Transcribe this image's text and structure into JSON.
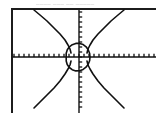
{
  "screen": {
    "header_text": "____ ___ __ _____",
    "frame_color": "#1c1c1c",
    "background_color": "#ffffff",
    "curve_color": "#111111",
    "axis_color": "#111111"
  },
  "chart_data": {
    "type": "scatter",
    "title": "",
    "xlabel": "",
    "ylabel": "",
    "grid": false,
    "legend": null,
    "axes": {
      "origin_px": [
        79,
        57
      ],
      "x_axis_y_px": 57,
      "y_axis_x_px": 79,
      "tick_spacing_px": 5,
      "xlim": [
        -13.6,
        15.4
      ],
      "ylim": [
        -11.2,
        9.8
      ],
      "tick_marks": "hash marks on both axes"
    },
    "series": [
      {
        "name": "unit-circle",
        "kind": "circle",
        "center": [
          0,
          0
        ],
        "radius_px": 11,
        "points_px": [
          [
            90,
            57
          ],
          [
            89.6,
            60.8
          ],
          [
            88.2,
            64.3
          ],
          [
            86.0,
            67.2
          ],
          [
            83.1,
            69.4
          ],
          [
            79.6,
            70.8
          ],
          [
            75.8,
            70.9
          ],
          [
            72.2,
            69.7
          ],
          [
            69.3,
            67.5
          ],
          [
            67.2,
            64.5
          ],
          [
            66.2,
            61.0
          ],
          [
            66.2,
            53.2
          ],
          [
            67.3,
            49.8
          ],
          [
            69.4,
            46.8
          ],
          [
            72.3,
            44.7
          ],
          [
            75.8,
            43.4
          ],
          [
            79.6,
            43.4
          ],
          [
            83.2,
            44.6
          ],
          [
            86.1,
            46.8
          ],
          [
            88.2,
            49.7
          ],
          [
            89.6,
            53.2
          ],
          [
            90,
            57
          ]
        ]
      },
      {
        "name": "branch-upper-left",
        "kind": "curve",
        "points_px": [
          [
            34,
            10
          ],
          [
            40,
            15
          ],
          [
            47,
            21
          ],
          [
            54,
            28
          ],
          [
            60,
            34
          ],
          [
            65,
            40
          ],
          [
            68,
            45
          ],
          [
            70,
            49
          ],
          [
            71,
            53
          ]
        ]
      },
      {
        "name": "branch-upper-right",
        "kind": "curve",
        "points_px": [
          [
            124,
            10
          ],
          [
            118,
            15
          ],
          [
            111,
            21
          ],
          [
            104,
            28
          ],
          [
            98,
            34
          ],
          [
            93,
            40
          ],
          [
            90,
            45
          ],
          [
            88,
            49
          ],
          [
            87,
            53
          ]
        ]
      },
      {
        "name": "branch-lower-left",
        "kind": "curve",
        "points_px": [
          [
            34,
            108
          ],
          [
            40,
            102
          ],
          [
            47,
            95
          ],
          [
            54,
            88
          ],
          [
            60,
            81
          ],
          [
            65,
            74
          ],
          [
            68,
            69
          ],
          [
            70,
            65
          ],
          [
            71,
            61
          ]
        ]
      },
      {
        "name": "branch-lower-right",
        "kind": "curve",
        "points_px": [
          [
            124,
            108
          ],
          [
            118,
            102
          ],
          [
            111,
            95
          ],
          [
            104,
            88
          ],
          [
            98,
            81
          ],
          [
            93,
            74
          ],
          [
            90,
            69
          ],
          [
            88,
            65
          ],
          [
            87,
            61
          ]
        ]
      }
    ]
  }
}
